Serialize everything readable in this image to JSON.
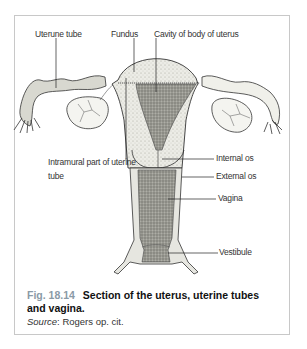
{
  "figure": {
    "labels": {
      "uterine_tube": "Uterune tube",
      "fundus": "Fundus",
      "cavity": "Cavity of body of uterus",
      "intramural_line1": "Intramural part of uterine",
      "intramural_line2": "tube",
      "internal_os": "Internal os",
      "external_os": "External os",
      "vagina": "Vagina",
      "vestibule": "Vestibule"
    },
    "caption": {
      "number": "Fig. 18.14",
      "title": "Section of the uterus, uterine tubes and vagina.",
      "source_label": "Source",
      "source_text": ": Rogers op. cit."
    },
    "colors": {
      "fig_number": "#8a9aa6",
      "frame_border": "#c8c8c8"
    }
  }
}
